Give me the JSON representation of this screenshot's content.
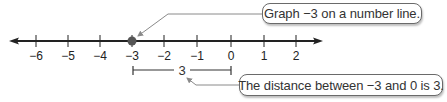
{
  "number_line": {
    "ticks": [
      {
        "value": -6,
        "label": "−6",
        "x": 36
      },
      {
        "value": -5,
        "label": "−5",
        "x": 68
      },
      {
        "value": -4,
        "label": "−4",
        "x": 100
      },
      {
        "value": -3,
        "label": "−3",
        "x": 132
      },
      {
        "value": -2,
        "label": "−2",
        "x": 164
      },
      {
        "value": -1,
        "label": "−1",
        "x": 197
      },
      {
        "value": 0,
        "label": "0",
        "x": 231
      },
      {
        "value": 1,
        "label": "1",
        "x": 264
      },
      {
        "value": 2,
        "label": "2",
        "x": 296
      }
    ],
    "plotted_point": {
      "value": -3,
      "color": "#555555"
    },
    "line_color": "#222222"
  },
  "distance_bracket": {
    "from": -3,
    "to": 0,
    "label": "3"
  },
  "callouts": {
    "top": "Graph −3 on a number line.",
    "bottom": "The distance between −3 and 0 is 3."
  }
}
